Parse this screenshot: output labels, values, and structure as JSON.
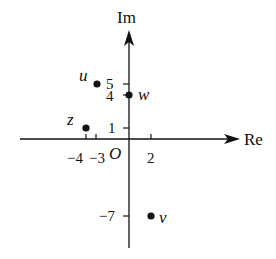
{
  "diagram": {
    "axes": {
      "real_label": "Re",
      "imag_label": "Im",
      "origin_label": "O"
    },
    "x_ticks": [
      {
        "value": -4,
        "label": "−4"
      },
      {
        "value": -3,
        "label": "−3"
      },
      {
        "value": 2,
        "label": "2"
      }
    ],
    "y_ticks": [
      {
        "value": 5,
        "label": "5"
      },
      {
        "value": 4,
        "label": "4"
      },
      {
        "value": 1,
        "label": "1"
      },
      {
        "value": -7,
        "label": "−7"
      }
    ],
    "points": [
      {
        "name": "u",
        "re": -3,
        "im": 5
      },
      {
        "name": "w",
        "re": 0,
        "im": 4
      },
      {
        "name": "z",
        "re": -4,
        "im": 1
      },
      {
        "name": "v",
        "re": 2,
        "im": -7
      }
    ],
    "colors": {
      "ink": "#111111",
      "background": "#ffffff"
    }
  }
}
